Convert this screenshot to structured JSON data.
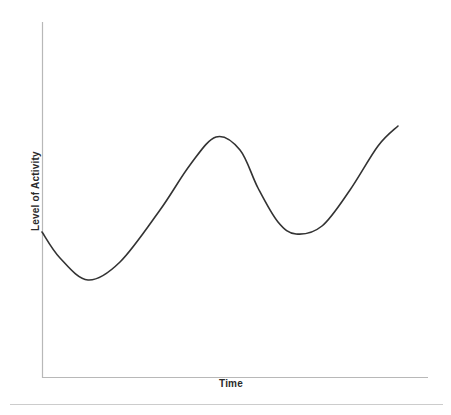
{
  "figure": {
    "name": "level-of-activity-over-time",
    "background_color": "#ffffff"
  },
  "axes": {
    "x_label": "Time",
    "y_label": "Level of Activity",
    "axis_color": "#b8b8b8",
    "label_color": "#2b2b2b"
  },
  "separator": {
    "color": "#cccccc"
  },
  "chart_data": {
    "type": "line",
    "title": "",
    "subtitle": "",
    "xlabel": "Time",
    "ylabel": "Level of Activity",
    "xlim": [
      0,
      100
    ],
    "ylim": [
      0,
      100
    ],
    "grid": false,
    "legend": false,
    "legend_position": "none",
    "tick_labels_x": [],
    "tick_labels_y": [],
    "annotations": [],
    "series": [
      {
        "name": "Level of Activity",
        "color": "#333333",
        "line_width": 1.6,
        "smooth": true,
        "x": [
          0,
          4,
          8,
          12,
          16,
          20,
          24,
          28,
          32,
          36,
          40,
          44,
          48,
          52,
          56,
          60,
          64,
          68,
          72,
          76,
          80,
          84,
          88,
          92
        ],
        "y": [
          41,
          33,
          29,
          27,
          28,
          32,
          38,
          46,
          56,
          65,
          472,
          68,
          60,
          51,
          44,
          41,
          41,
          45,
          52,
          61,
          70,
          75,
          77,
          78
        ]
      }
    ],
    "path_points": [
      {
        "x": 42,
        "y": 232,
        "role": "start"
      },
      {
        "x": 60,
        "y": 258,
        "role": "falling"
      },
      {
        "x": 88,
        "y": 280,
        "role": "local-minimum"
      },
      {
        "x": 120,
        "y": 262,
        "role": "rising"
      },
      {
        "x": 160,
        "y": 210,
        "role": "inflection-rising"
      },
      {
        "x": 190,
        "y": 165,
        "role": "rising"
      },
      {
        "x": 216,
        "y": 137,
        "role": "local-maximum"
      },
      {
        "x": 240,
        "y": 150,
        "role": "falling"
      },
      {
        "x": 258,
        "y": 188,
        "role": "inflection-falling"
      },
      {
        "x": 278,
        "y": 222,
        "role": "falling"
      },
      {
        "x": 296,
        "y": 234,
        "role": "local-minimum"
      },
      {
        "x": 322,
        "y": 226,
        "role": "rising"
      },
      {
        "x": 350,
        "y": 190,
        "role": "inflection-rising"
      },
      {
        "x": 378,
        "y": 146,
        "role": "rising"
      },
      {
        "x": 398,
        "y": 126,
        "role": "end"
      }
    ]
  }
}
